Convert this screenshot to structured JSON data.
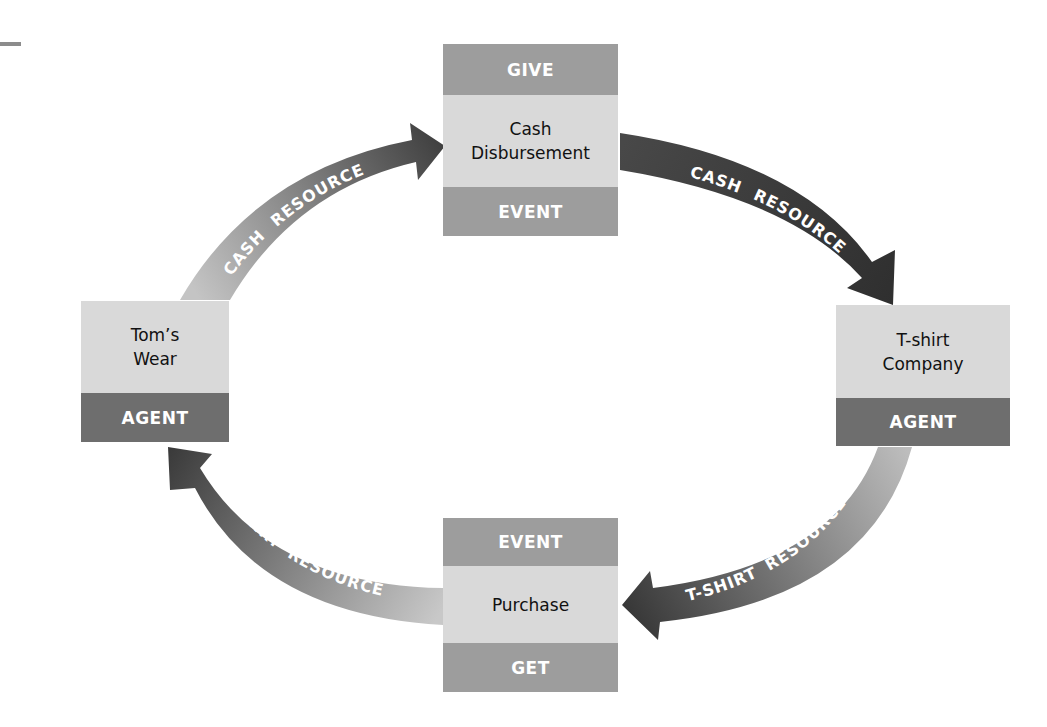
{
  "diagram": {
    "nodes": {
      "cash_disbursement": {
        "top_label": "GIVE",
        "name_line1": "Cash",
        "name_line2": "Disbursement",
        "bottom_label": "EVENT"
      },
      "t_shirt_company": {
        "name_line1": "T-shirt",
        "name_line2": "Company",
        "bottom_label": "AGENT"
      },
      "purchase": {
        "top_label": "EVENT",
        "name": "Purchase",
        "bottom_label": "GET"
      },
      "toms_wear": {
        "name_line1": "Tom’s",
        "name_line2": "Wear",
        "bottom_label": "AGENT"
      }
    },
    "arrows": {
      "toms_to_disbursement": {
        "word1": "CASH",
        "word2": "RESOURCE"
      },
      "disbursement_to_tshirt": {
        "word1": "CASH",
        "word2": "RESOURCE"
      },
      "tshirt_to_purchase": {
        "word1": "T-SHIRT",
        "word2": "RESOURCE"
      },
      "purchase_to_toms": {
        "word1": "T-SHIRT",
        "word2": "RESOURCE"
      }
    },
    "colors": {
      "band_mid": "#9d9d9d",
      "band_dark": "#6e6e6e",
      "box_body": "#d9d9d9",
      "arrow_light": "#bdbdbd",
      "arrow_dark": "#3f3f3f"
    }
  }
}
